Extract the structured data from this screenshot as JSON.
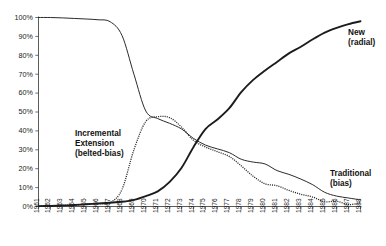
{
  "chart_data": {
    "type": "line",
    "title": "",
    "subtitle": "",
    "xlabel": "",
    "ylabel": "",
    "ylim": [
      0,
      100
    ],
    "ytick_labels": [
      "0%",
      "10%",
      "20%",
      "30%",
      "40%",
      "50%",
      "60%",
      "70%",
      "80%",
      "90%",
      "100%"
    ],
    "ytick_values": [
      0,
      10,
      20,
      30,
      40,
      50,
      60,
      70,
      80,
      90,
      100
    ],
    "grid": false,
    "legend_position": "inline-annotations",
    "categories": [
      "1961",
      "1962",
      "1963",
      "1964",
      "1965",
      "1966",
      "1967",
      "1968",
      "1969",
      "1970",
      "1971",
      "1972",
      "1973",
      "1974",
      "1975",
      "1976",
      "1977",
      "1978",
      "1979",
      "1980",
      "1981",
      "1982",
      "1983",
      "1984",
      "1985",
      "1986",
      "1987",
      "1988"
    ],
    "x": [
      1961,
      1962,
      1963,
      1964,
      1965,
      1966,
      1967,
      1968,
      1969,
      1970,
      1971,
      1972,
      1973,
      1974,
      1975,
      1976,
      1977,
      1978,
      1979,
      1980,
      1981,
      1982,
      1983,
      1984,
      1985,
      1986,
      1987,
      1988
    ],
    "series": [
      {
        "name": "Traditional (bias)",
        "style": "solid-thin",
        "annotation": "Traditional\n(bias)",
        "values": [
          100,
          100,
          99.8,
          99.5,
          99.2,
          98.8,
          97.8,
          90.5,
          70.0,
          50.5,
          46.5,
          44.0,
          41.0,
          36.0,
          32.5,
          30.5,
          28.5,
          25.0,
          23.5,
          22.5,
          19.0,
          17.0,
          14.5,
          11.5,
          7.5,
          5.5,
          4.5,
          3.5
        ]
      },
      {
        "name": "Incremental Extension (belted-bias)",
        "style": "dotted",
        "annotation": "Incremental\nExtension\n(belted-bias)",
        "values": [
          0.3,
          0.4,
          0.6,
          0.8,
          1.2,
          1.5,
          2.0,
          9.0,
          30.0,
          45.0,
          47.5,
          47.0,
          42.0,
          35.0,
          31.5,
          29.0,
          26.5,
          21.5,
          16.0,
          12.0,
          11.0,
          8.5,
          6.5,
          5.0,
          2.5,
          2.8,
          1.0,
          2.0
        ]
      },
      {
        "name": "New (radial)",
        "style": "solid-thick",
        "annotation": "New\n(radial)",
        "values": [
          0.2,
          0.3,
          0.5,
          0.8,
          1.2,
          1.6,
          2.0,
          2.5,
          3.5,
          5.5,
          8.0,
          13.0,
          20.5,
          31.5,
          41.0,
          46.0,
          52.0,
          60.5,
          67.0,
          72.0,
          76.5,
          81.0,
          84.5,
          88.5,
          92.0,
          94.5,
          96.5,
          98.0
        ]
      }
    ]
  },
  "annotations": {
    "new_radial_line1": "New",
    "new_radial_line2": "(radial)",
    "traditional_line1": "Traditional",
    "traditional_line2": "(bias)",
    "incremental_line1": "Incremental",
    "incremental_line2": "Extension",
    "incremental_line3": "(belted-bias)"
  },
  "colors": {
    "background": "#ffffff",
    "axis": "#4a4a4a",
    "text": "#1a1a1a",
    "traditional": "#2b2b2b",
    "incremental": "#2b2b2b",
    "new": "#1c1c1c"
  }
}
